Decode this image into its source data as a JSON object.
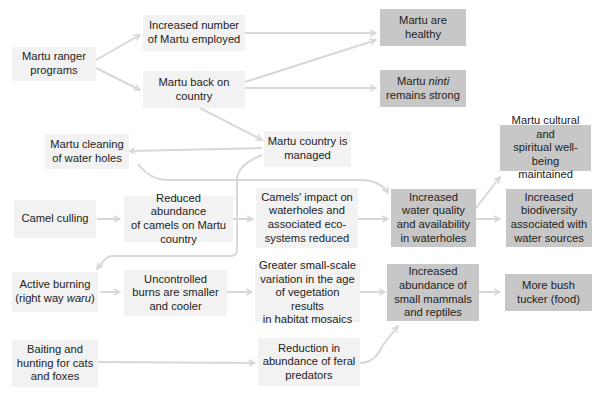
{
  "diagram": {
    "colors": {
      "input_box": "#f2f2f2",
      "outcome_box": "#c7c7c7",
      "arrow": "#d8d8d8",
      "text": "#222222"
    },
    "nodes": [
      {
        "id": "ranger",
        "lines": [
          "Martu ranger",
          "programs"
        ]
      },
      {
        "id": "employed",
        "lines": [
          "Increased number",
          "of Martu employed"
        ]
      },
      {
        "id": "back",
        "lines": [
          "Martu back on",
          "country"
        ]
      },
      {
        "id": "healthy",
        "lines": [
          "Martu are healthy"
        ]
      },
      {
        "id": "ninti",
        "pre": "Martu ",
        "italic": "ninti",
        "line2": "remains strong"
      },
      {
        "id": "cleaning",
        "lines": [
          "Martu cleaning",
          "of water holes"
        ]
      },
      {
        "id": "managed",
        "lines": [
          "Martu country is",
          "managed"
        ]
      },
      {
        "id": "cultural",
        "lines": [
          "Martu cultural and",
          "spiritual well-being",
          "maintained"
        ]
      },
      {
        "id": "culling",
        "lines": [
          "Camel culling"
        ]
      },
      {
        "id": "reduced",
        "lines": [
          "Reduced abundance",
          "of camels on Martu",
          "country"
        ]
      },
      {
        "id": "impact",
        "lines": [
          "Camels' impact on",
          "waterholes and",
          "associated eco-",
          "systems reduced"
        ]
      },
      {
        "id": "water",
        "lines": [
          "Increased",
          "water quality",
          "and availability",
          "in waterholes"
        ]
      },
      {
        "id": "biodiv",
        "lines": [
          "Increased",
          "biodiversity",
          "associated with",
          "water sources"
        ]
      },
      {
        "id": "burning",
        "line1": "Active burning",
        "pre": "(right way ",
        "italic": "waru",
        "post": ")"
      },
      {
        "id": "uncontrolled",
        "lines": [
          "Uncontrolled",
          "burns are smaller",
          "and cooler"
        ]
      },
      {
        "id": "variation",
        "lines": [
          "Greater small-scale",
          "variation in the age",
          "of vegetation results",
          "in habitat mosaics"
        ]
      },
      {
        "id": "mammals",
        "lines": [
          "Increased",
          "abundance of",
          "small mammals",
          "and reptiles"
        ]
      },
      {
        "id": "tucker",
        "lines": [
          "More bush",
          "tucker (food)"
        ]
      },
      {
        "id": "baiting",
        "lines": [
          "Baiting and",
          "hunting for cats",
          "and foxes"
        ]
      },
      {
        "id": "predators",
        "lines": [
          "Reduction in",
          "abundance of feral",
          "predators"
        ]
      }
    ],
    "edges": [
      [
        "ranger",
        "employed"
      ],
      [
        "ranger",
        "back"
      ],
      [
        "employed",
        "healthy"
      ],
      [
        "back",
        "healthy"
      ],
      [
        "back",
        "ninti"
      ],
      [
        "back",
        "managed"
      ],
      [
        "managed",
        "cleaning"
      ],
      [
        "cleaning",
        "water"
      ],
      [
        "managed",
        "burning"
      ],
      [
        "culling",
        "reduced"
      ],
      [
        "reduced",
        "impact"
      ],
      [
        "impact",
        "water"
      ],
      [
        "water",
        "cultural"
      ],
      [
        "water",
        "biodiv"
      ],
      [
        "burning",
        "uncontrolled"
      ],
      [
        "uncontrolled",
        "variation"
      ],
      [
        "variation",
        "mammals"
      ],
      [
        "mammals",
        "tucker"
      ],
      [
        "baiting",
        "predators"
      ],
      [
        "predators",
        "mammals"
      ]
    ]
  }
}
